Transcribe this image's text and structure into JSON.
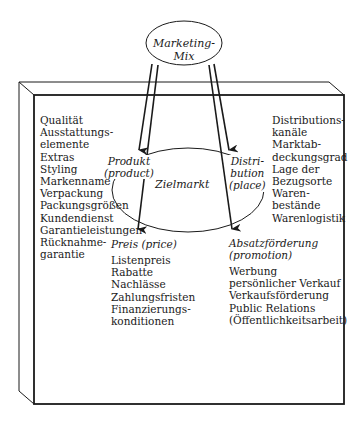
{
  "diagram": {
    "title": "Marketing-Mix",
    "center": "Zielmarkt",
    "segments": {
      "product": {
        "label_lines": [
          "Produkt",
          "(product)"
        ],
        "items": [
          "Qualität",
          "Ausstattungs-",
          "elemente",
          "Extras",
          "Styling",
          "Markenname",
          "Verpackung",
          "Packungsgrößen",
          "Kundendienst",
          "Garantieleistungen",
          "Rücknahme-",
          "garantie"
        ]
      },
      "place": {
        "label_lines": [
          "Distri-",
          "bution",
          "(place)"
        ],
        "items": [
          "Distributions-",
          "kanäle",
          "Marktab-",
          "deckungsgrad",
          "Lage der",
          "Bezugsorte",
          "Waren-",
          "bestände",
          "Warenlogistik"
        ]
      },
      "price": {
        "label": "Preis (price)",
        "items": [
          "Listenpreis",
          "Rabatte",
          "Nachlässe",
          "Zahlungsfristen",
          "Finanzierungs-",
          "konditionen"
        ]
      },
      "promotion": {
        "label_lines": [
          "Absatzförderung",
          "(promotion)"
        ],
        "items": [
          "Werbung",
          "persönlicher Verkauf",
          "Verkaufsförderung",
          "Public Relations",
          "(Öffentlichkeitsarbeit)"
        ]
      }
    },
    "colors": {
      "line": "#1a1a1a",
      "background": "#ffffff"
    }
  }
}
